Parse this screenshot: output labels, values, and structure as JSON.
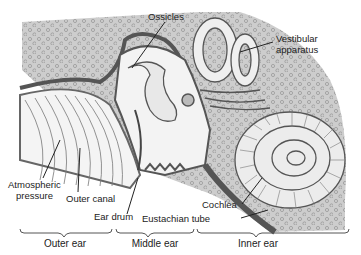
{
  "diagram": {
    "labels": {
      "ossicles": "Ossicles",
      "vestibular_line1": "Vestibular",
      "vestibular_line2": "apparatus",
      "atmospheric_line1": "Atmospheric",
      "atmospheric_line2": "pressure",
      "outer_canal": "Outer canal",
      "ear_drum": "Ear drum",
      "cochlea": "Cochlea",
      "eustachian_tube": "Eustachian tube"
    },
    "sections": [
      {
        "label": "Outer ear"
      },
      {
        "label": "Middle ear"
      },
      {
        "label": "Inner ear"
      }
    ],
    "colors": {
      "bone": "#cfcfcf",
      "dots": "#9a9a9a",
      "outline": "#555555",
      "tissue": "#e6e6e6"
    }
  }
}
